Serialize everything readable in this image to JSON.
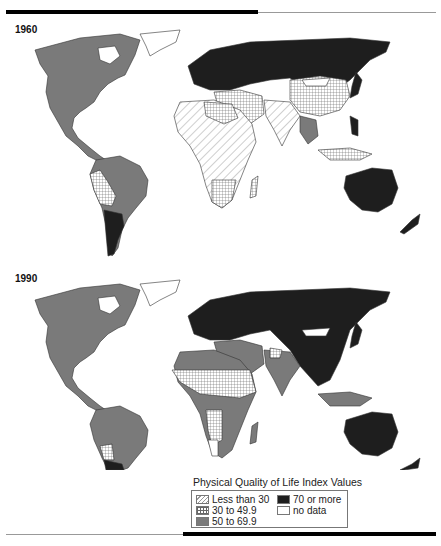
{
  "panels": [
    {
      "year_label": "1960"
    },
    {
      "year_label": "1990"
    }
  ],
  "legend": {
    "title": "Physical Quality of Life Index Values",
    "items": [
      {
        "label": "Less than 30",
        "pattern": "diagonal-hatch"
      },
      {
        "label": "30 to 49.9",
        "pattern": "crosshatch-grid"
      },
      {
        "label": "50 to 69.9",
        "pattern": "solid",
        "color": "#7a7a7a"
      },
      {
        "label": "70 or more",
        "pattern": "solid",
        "color": "#1e1e1e"
      },
      {
        "label": "no data",
        "pattern": "solid",
        "color": "#ffffff"
      }
    ]
  },
  "colors": {
    "band_lt30": "diagonal-hatch",
    "band_30_49": "crosshatch",
    "band_50_69": "#7a7a7a",
    "band_70plus": "#1e1e1e",
    "no_data": "#ffffff"
  }
}
